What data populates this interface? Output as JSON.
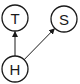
{
  "diagram": {
    "type": "directed-graph",
    "nodes": [
      {
        "id": "T",
        "label": "T"
      },
      {
        "id": "S",
        "label": "S"
      },
      {
        "id": "H",
        "label": "H"
      }
    ],
    "edges": [
      {
        "from": "H",
        "to": "T"
      },
      {
        "from": "H",
        "to": "S"
      }
    ]
  }
}
